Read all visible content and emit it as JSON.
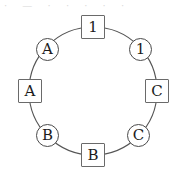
{
  "figure": {
    "background_color": "#ffffff",
    "stroke_color": "#555555",
    "text_color": "#1c1c1c",
    "artifact_text": "· — ·    · · · ·"
  },
  "ring": {
    "center_x": 93,
    "center_y": 91,
    "radius": 64
  },
  "nodes": [
    {
      "label": "1",
      "shape": "square",
      "position": "top",
      "x": 81,
      "y": 15
    },
    {
      "label": "1",
      "shape": "circle",
      "position": "top-right",
      "x": 129,
      "y": 38
    },
    {
      "label": "C",
      "shape": "square",
      "position": "right",
      "x": 145,
      "y": 79
    },
    {
      "label": "C",
      "shape": "circle",
      "position": "bottom-right",
      "x": 127,
      "y": 124
    },
    {
      "label": "B",
      "shape": "square",
      "position": "bottom",
      "x": 81,
      "y": 143
    },
    {
      "label": "B",
      "shape": "circle",
      "position": "bottom-left",
      "x": 36,
      "y": 124
    },
    {
      "label": "A",
      "shape": "square",
      "position": "left",
      "x": 18,
      "y": 79
    },
    {
      "label": "A",
      "shape": "circle",
      "position": "top-left",
      "x": 36,
      "y": 38
    }
  ]
}
